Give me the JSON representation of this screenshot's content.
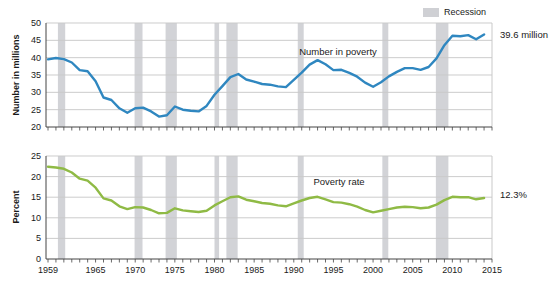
{
  "chart_data": {
    "type": "line",
    "years": [
      1959,
      1960,
      1961,
      1962,
      1963,
      1964,
      1965,
      1966,
      1967,
      1968,
      1969,
      1970,
      1971,
      1972,
      1973,
      1974,
      1975,
      1976,
      1977,
      1978,
      1979,
      1980,
      1981,
      1982,
      1983,
      1984,
      1985,
      1986,
      1987,
      1988,
      1989,
      1990,
      1991,
      1992,
      1993,
      1994,
      1995,
      1996,
      1997,
      1998,
      1999,
      2000,
      2001,
      2002,
      2003,
      2004,
      2005,
      2006,
      2007,
      2008,
      2009,
      2010,
      2011,
      2012,
      2013,
      2014
    ],
    "series": [
      {
        "name": "Number in poverty",
        "panel": "top",
        "ylabel": "Number in millions",
        "ylim": [
          20,
          50
        ],
        "ytick_step": 5,
        "yticks": [
          20,
          25,
          30,
          35,
          40,
          45,
          50
        ],
        "color": "#2f87c0",
        "end_annotation": "39.6 million",
        "values": [
          39.5,
          39.9,
          39.6,
          38.6,
          36.4,
          36.1,
          33.2,
          28.5,
          27.8,
          25.4,
          24.1,
          25.4,
          25.6,
          24.5,
          23.0,
          23.4,
          25.9,
          25.0,
          24.7,
          24.5,
          26.1,
          29.3,
          31.8,
          34.4,
          35.3,
          33.7,
          33.1,
          32.4,
          32.2,
          31.7,
          31.5,
          33.6,
          35.7,
          38.0,
          39.3,
          38.1,
          36.4,
          36.5,
          35.6,
          34.5,
          32.8,
          31.6,
          32.9,
          34.6,
          35.9,
          37.0,
          37.0,
          36.5,
          37.3,
          39.8,
          43.6,
          46.3,
          46.2,
          46.5,
          45.3,
          46.7
        ]
      },
      {
        "name": "Poverty rate",
        "panel": "bottom",
        "ylabel": "Percent",
        "ylim": [
          0,
          25
        ],
        "ytick_step": 5,
        "yticks": [
          0,
          5,
          10,
          15,
          20,
          25
        ],
        "color": "#8fba45",
        "end_annotation": "12.3%",
        "values": [
          22.4,
          22.2,
          21.9,
          21.0,
          19.5,
          19.0,
          17.3,
          14.7,
          14.2,
          12.8,
          12.1,
          12.6,
          12.5,
          11.9,
          11.1,
          11.2,
          12.3,
          11.8,
          11.6,
          11.4,
          11.7,
          13.0,
          14.0,
          15.0,
          15.2,
          14.4,
          14.0,
          13.6,
          13.4,
          13.0,
          12.8,
          13.5,
          14.2,
          14.8,
          15.1,
          14.5,
          13.8,
          13.7,
          13.3,
          12.7,
          11.9,
          11.3,
          11.7,
          12.1,
          12.5,
          12.7,
          12.6,
          12.3,
          12.5,
          13.2,
          14.3,
          15.1,
          15.0,
          15.0,
          14.5,
          14.8
        ]
      }
    ],
    "x_tick_labels": [
      "1959",
      "1965",
      "1970",
      "1975",
      "1980",
      "1985",
      "1990",
      "1995",
      "2000",
      "2005",
      "2010",
      "2015"
    ],
    "x_axis_range": [
      1959,
      2015
    ],
    "recession_bands": [
      [
        1960.25,
        1961.17
      ],
      [
        1969.92,
        1970.92
      ],
      [
        1973.83,
        1975.25
      ],
      [
        1980.0,
        1980.58
      ],
      [
        1981.5,
        1982.92
      ],
      [
        1990.5,
        1991.25
      ],
      [
        2001.17,
        2001.92
      ],
      [
        2007.92,
        2009.5
      ]
    ],
    "legend": {
      "recession_label": "Recession"
    },
    "grid": true,
    "colors": {
      "blue_line": "#2f87c0",
      "green_line": "#8fba45",
      "recession_band": "#d2d3d7",
      "gridline": "#c9c9c9",
      "axis": "#444444",
      "text": "#1a1a1a"
    }
  }
}
